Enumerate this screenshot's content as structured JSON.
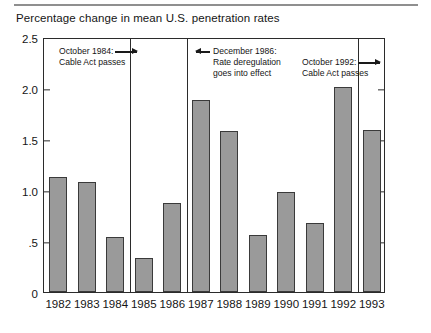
{
  "chart_data": {
    "type": "bar",
    "title": "Percentage change in mean U.S. penetration rates",
    "xlabel": "",
    "ylabel": "",
    "ylim": [
      0,
      2.5
    ],
    "grid": false,
    "legend": "none",
    "categories": [
      "1982",
      "1983",
      "1984",
      "1985",
      "1986",
      "1987",
      "1988",
      "1989",
      "1990",
      "1991",
      "1992",
      "1993"
    ],
    "values": [
      1.13,
      1.08,
      0.54,
      0.33,
      0.87,
      1.88,
      1.58,
      0.56,
      0.98,
      0.68,
      2.01,
      1.59
    ],
    "ytick_labels": [
      "0",
      ".5",
      "1.0",
      "1.5",
      "2.0",
      "2.5"
    ],
    "ytick_values": [
      0,
      0.5,
      1.0,
      1.5,
      2.0,
      2.5
    ],
    "annotations": [
      {
        "id": "oct-1984",
        "lines": [
          "October 1984:",
          "Cable Act passes"
        ],
        "arrow": "right",
        "target_year": "1984/1985 boundary"
      },
      {
        "id": "dec-1986",
        "lines": [
          "December 1986:",
          "Rate deregulation",
          "goes into effect"
        ],
        "arrow": "left",
        "target_year": "1986/1987 boundary"
      },
      {
        "id": "oct-1992",
        "lines": [
          "October 1992:",
          "Cable Act passes"
        ],
        "arrow": "right",
        "target_year": "1992/1993 boundary"
      }
    ],
    "separator_lines": [
      "after 1984",
      "before 1987",
      "after 1992"
    ],
    "colors": {
      "bar_fill": "#9a9a9a",
      "bar_edge": "#3a3a3a",
      "axis": "#2b2b2b",
      "text": "#151515",
      "background": "#ffffff"
    }
  }
}
